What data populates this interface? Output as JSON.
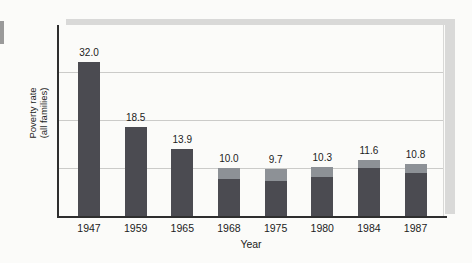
{
  "figure": {
    "background": "#fbfbf9",
    "type_note": "static bar chart figure"
  },
  "chart_data": {
    "type": "bar",
    "categories": [
      "1947",
      "1959",
      "1965",
      "1968",
      "1975",
      "1980",
      "1984",
      "1987"
    ],
    "values": [
      32.0,
      18.5,
      13.9,
      10.0,
      9.7,
      10.3,
      11.6,
      10.8
    ],
    "value_labels": [
      "32.0",
      "18.5",
      "13.9",
      "10.0",
      "9.7",
      "10.3",
      "11.6",
      "10.8"
    ],
    "title": "",
    "xlabel": "Year",
    "ylabel_line1": "Poverty rate",
    "ylabel_line2": "(all families)",
    "ylim": [
      0,
      40
    ],
    "gridline_values": [
      10,
      20,
      30
    ],
    "y_tick_labels_visible": false,
    "legend": "none",
    "cap_heights_px": [
      0,
      0,
      0,
      11,
      12,
      10,
      8,
      9
    ],
    "colors": {
      "bar": "#4b4b51",
      "bar_cap": "#8d9196",
      "shadow_band": "#d9d9d8",
      "gridline": "#cbcbc9",
      "axis": "#2e2e2e",
      "text": "#1c1c1c",
      "background": "#fbfbf9",
      "left_fragment": "#9a9a9a"
    }
  }
}
